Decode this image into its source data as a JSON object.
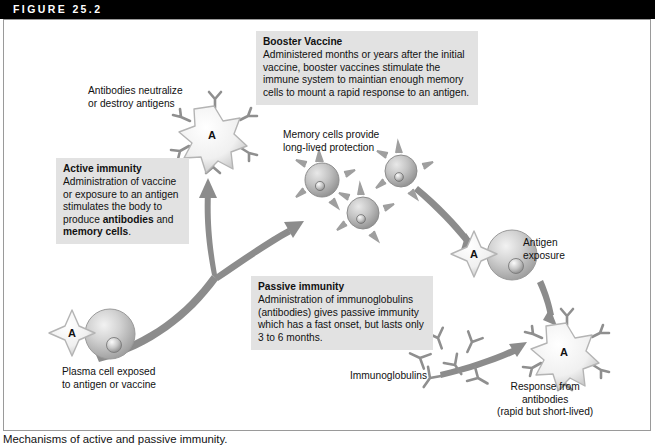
{
  "figure": {
    "header_label": "FIGURE 25.2",
    "caption": "Mechanisms of active and passive immunity."
  },
  "callouts": {
    "booster": {
      "title": "Booster Vaccine",
      "body": "Administered months or years after the initial vaccine, booster vaccines stimulate the immune system to maintian enough memory cells to mount a rapid response to an antigen."
    },
    "active": {
      "title": "Active immunity",
      "body_part1": "Administration of vaccine or exposure to an antigen stimulates the body to produce ",
      "bold1": "antibodies",
      "body_part2": " and ",
      "bold2": "memory cells",
      "body_part3": "."
    },
    "passive": {
      "title": "Passive immunity",
      "body": "Administration of immunoglobulins (antibodies) gives passive immunity which has a fast onset, but lasts only 3 to 6 months."
    }
  },
  "labels": {
    "antibodies_neutralize": "Antibodies neutralize\nor destroy antigens",
    "memory_cells": "Memory cells provide\nlong-lived protection",
    "antigen_exposure": "Antigen\nexposure",
    "immunoglobulins": "Immunoglobulins",
    "plasma_cell": "Plasma cell exposed\nto antigen or vaccine",
    "response": "Response from\nantibodies\n(rapid but short-lived)"
  },
  "diagram": {
    "antigen_letter": "A",
    "colors": {
      "header_bar": "#000000",
      "callout_bg": "#e2e2e2",
      "arrow": "#8c8c8c",
      "cell_body": "#c9c9c9",
      "antigen_fill": "#f2f2f2",
      "antibody": "#8f8f8f",
      "frame_border": "#9a9a9a"
    },
    "elements": [
      {
        "name": "antigen-antibody-complex-top",
        "letter": "A"
      },
      {
        "name": "plasma-cell-bottom-left",
        "letter": "A"
      },
      {
        "name": "memory-cell-cluster",
        "count": 3
      },
      {
        "name": "antigen-exposure-cell",
        "letter": "A"
      },
      {
        "name": "immunoglobulin-cluster",
        "count": 6
      },
      {
        "name": "antigen-antibody-complex-bottom-right",
        "letter": "A"
      }
    ]
  }
}
